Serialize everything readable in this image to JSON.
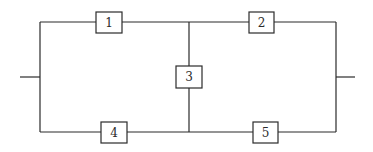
{
  "diagram": {
    "type": "reliability-block-diagram",
    "components": [
      {
        "id": "1",
        "label": "1",
        "x": 96,
        "y": 12,
        "w": 26,
        "h": 21
      },
      {
        "id": "2",
        "label": "2",
        "x": 249,
        "y": 12,
        "w": 25,
        "h": 21
      },
      {
        "id": "3",
        "label": "3",
        "x": 176,
        "y": 66,
        "w": 26,
        "h": 22
      },
      {
        "id": "4",
        "label": "4",
        "x": 101,
        "y": 122,
        "w": 26,
        "h": 21
      },
      {
        "id": "5",
        "label": "5",
        "x": 253,
        "y": 122,
        "w": 25,
        "h": 21
      }
    ],
    "connections": [
      {
        "from": "input",
        "to": "1"
      },
      {
        "from": "input",
        "to": "4"
      },
      {
        "from": "1",
        "to": "2"
      },
      {
        "from": "4",
        "to": "5"
      },
      {
        "from": "1-2 junction",
        "to": "3"
      },
      {
        "from": "3",
        "to": "4-5 junction"
      },
      {
        "from": "2",
        "to": "output"
      },
      {
        "from": "5",
        "to": "output"
      }
    ],
    "colors": {
      "line": "#2b2b2b",
      "background": "#ffffff"
    }
  }
}
